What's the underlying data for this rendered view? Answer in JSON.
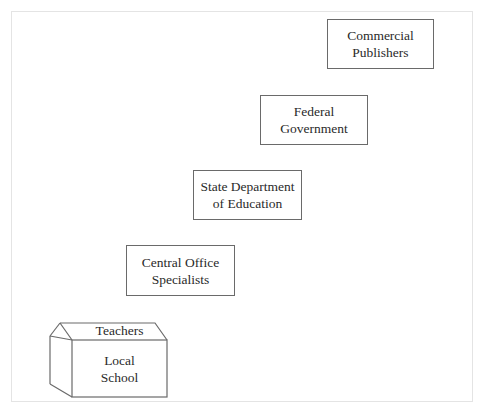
{
  "diagram": {
    "type": "hierarchy-staircase",
    "levels": [
      {
        "id": "local-school",
        "roof_label": "Teachers",
        "lines": [
          "Local",
          "School"
        ]
      },
      {
        "id": "central-office",
        "lines": [
          "Central Office",
          "Specialists"
        ]
      },
      {
        "id": "state-department",
        "lines": [
          "State Department",
          "of Education"
        ]
      },
      {
        "id": "federal-government",
        "lines": [
          "Federal",
          "Government"
        ]
      },
      {
        "id": "commercial-publishers",
        "lines": [
          "Commercial",
          "Publishers"
        ]
      }
    ]
  },
  "colors": {
    "stroke": "#6a6a6a",
    "text": "#2a2a2a",
    "frame": "#e4e4e4",
    "background": "#ffffff"
  }
}
